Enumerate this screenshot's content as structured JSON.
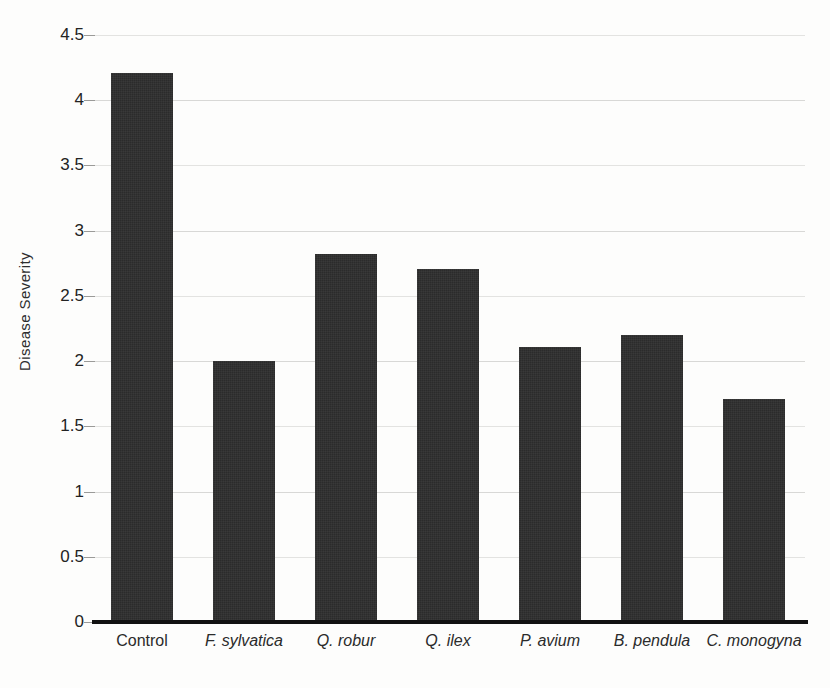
{
  "chart_data": {
    "type": "bar",
    "title": "",
    "xlabel": "",
    "ylabel": "Disease Severity",
    "categories": [
      "Control",
      "F. sylvatica",
      "Q. robur",
      "Q. ilex",
      "P. avium",
      "B. pendula",
      "C. monogyna"
    ],
    "category_styles": [
      "normal",
      "italic",
      "italic",
      "italic",
      "italic",
      "italic",
      "italic"
    ],
    "values": [
      4.21,
      2.0,
      2.82,
      2.71,
      2.11,
      2.2,
      1.71
    ],
    "ylim": [
      0,
      4.5
    ],
    "ytick_labels": [
      "0",
      "0.5",
      "1",
      "1.5",
      "2",
      "2.5",
      "3",
      "3.5",
      "4",
      "4.5"
    ],
    "ytick_values": [
      0,
      0.5,
      1,
      1.5,
      2,
      2.5,
      3,
      3.5,
      4,
      4.5
    ],
    "grid": true,
    "legend": false,
    "bar_color": "#2b2b2b",
    "grid_color": "#d8d8d6",
    "background_color": "#fdfdfc",
    "axis_color": "#111111"
  }
}
